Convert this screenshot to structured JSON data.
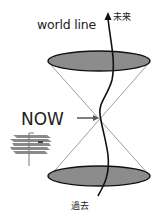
{
  "diagram": {
    "type": "light-cone",
    "labels": {
      "world_line": "world line",
      "future": "未来",
      "now": "NOW",
      "past": "過去"
    },
    "colors": {
      "ellipse_fill": "#8c8c8c",
      "ellipse_stroke": "#111111",
      "cone_lines": "#9a9a9a",
      "world_line": "#111111",
      "arrow": "#555555",
      "planes": "#777777"
    }
  }
}
